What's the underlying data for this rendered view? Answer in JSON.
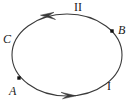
{
  "figure": {
    "type": "closed-curve-orientation-diagram",
    "background_color": "#ffffff",
    "stroke_color": "#3a3a3a",
    "marker_color": "#111111",
    "curve": {
      "shape": "ellipse",
      "center_x": 67,
      "center_y": 55,
      "radius_x": 55,
      "radius_y": 41,
      "stroke_width": 1.1,
      "orientation": "counterclockwise"
    },
    "labels": [
      {
        "id": "curve-name",
        "text": "C",
        "x": 3,
        "y": 33,
        "style": "italic"
      },
      {
        "id": "point-a",
        "text": "A",
        "x": 9,
        "y": 85,
        "style": "italic"
      },
      {
        "id": "point-b",
        "text": "B",
        "x": 118,
        "y": 24,
        "style": "italic"
      },
      {
        "id": "arc-one",
        "text": "I",
        "x": 107,
        "y": 80,
        "style": "roman"
      },
      {
        "id": "arc-two",
        "text": "II",
        "x": 74,
        "y": 1,
        "style": "roman"
      }
    ],
    "points": [
      {
        "id": "point-a-marker",
        "label": "A",
        "x": 19,
        "y": 78,
        "size": 3.4
      },
      {
        "id": "point-b-marker",
        "label": "B",
        "x": 112,
        "y": 31,
        "size": 3.4
      }
    ],
    "arrows": [
      {
        "id": "arrow-top",
        "on_arc": "II",
        "x": 46,
        "y": 17,
        "direction": "left"
      },
      {
        "id": "arrow-bottom",
        "on_arc": "I",
        "x": 69,
        "y": 95,
        "direction": "right"
      }
    ]
  }
}
